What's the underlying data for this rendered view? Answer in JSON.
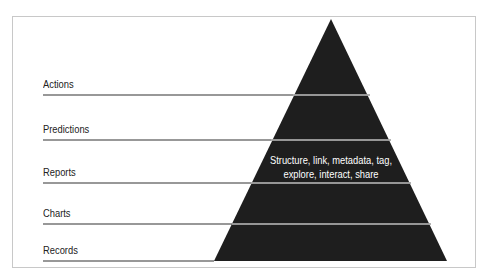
{
  "diagram": {
    "title": "",
    "levels": [
      {
        "label": "Actions",
        "y": 95
      },
      {
        "label": "Predictions",
        "y": 140
      },
      {
        "label": "Reports",
        "y": 183
      },
      {
        "label": "Charts",
        "y": 224
      },
      {
        "label": "Records",
        "y": 261
      }
    ],
    "pyramid_text_line1": "Structure, link, metadata, tag,",
    "pyramid_text_line2": "explore, interact, share",
    "colors": {
      "pyramid": "#1e1e1e",
      "lines": "#333333",
      "frame": "#c8c8c8"
    }
  }
}
